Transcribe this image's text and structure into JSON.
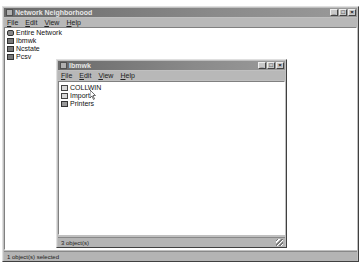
{
  "outer_window": {
    "title": "Network Neighborhood",
    "menu": [
      "File",
      "Edit",
      "View",
      "Help"
    ],
    "items": [
      {
        "label": "Entire Network",
        "icon": "network-globe-icon"
      },
      {
        "label": "Ibmwk",
        "icon": "computer-icon"
      },
      {
        "label": "Ncstate",
        "icon": "computer-icon"
      },
      {
        "label": "Pcsv",
        "icon": "computer-icon"
      }
    ],
    "status": "1 object(s) selected",
    "buttons": {
      "minimize": "_",
      "maximize": "□",
      "close": "×"
    }
  },
  "inner_window": {
    "title": "Ibmwk",
    "menu": [
      "File",
      "Edit",
      "View",
      "Help"
    ],
    "items": [
      {
        "label": "COLLWIN",
        "icon": "shared-folder-icon"
      },
      {
        "label": "Import",
        "icon": "shared-folder-icon"
      },
      {
        "label": "Printers",
        "icon": "printers-folder-icon"
      }
    ],
    "status": "3 object(s)",
    "buttons": {
      "minimize": "_",
      "maximize": "□",
      "close": "×"
    }
  }
}
